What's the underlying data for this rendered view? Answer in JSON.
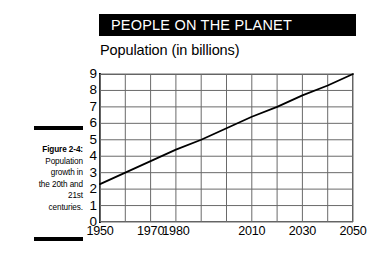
{
  "figure": {
    "header_title": "PEOPLE ON THE PLANET",
    "subtitle": "Population (in billions)",
    "caption": {
      "label": "Figure 2-4:",
      "lines": [
        "Population",
        "growth in",
        "the 20th and",
        "21st",
        "centuries."
      ]
    },
    "colors": {
      "header_background": "#000000",
      "header_text": "#ffffff",
      "grid_line": "#6a6a6a",
      "series_line": "#000000",
      "page_background": "#ffffff",
      "rule": "#000000"
    }
  },
  "chart_data": {
    "type": "line",
    "title": "Population (in billions)",
    "xlabel": "",
    "ylabel": "",
    "grid": true,
    "legend": "none",
    "xlim": [
      1950,
      2050
    ],
    "ylim": [
      0,
      9
    ],
    "x_tick_labels": [
      "1950",
      "1970",
      "1980",
      "2010",
      "2030",
      "2050"
    ],
    "x_tick_values": [
      1950,
      1970,
      1980,
      2010,
      2030,
      2050
    ],
    "x_gridline_values": [
      1950,
      1960,
      1970,
      1980,
      1990,
      2000,
      2010,
      2020,
      2030,
      2040,
      2050
    ],
    "y_tick_labels": [
      "0",
      "1",
      "2",
      "3",
      "4",
      "5",
      "6",
      "7",
      "8",
      "9"
    ],
    "y_tick_values": [
      0,
      1,
      2,
      3,
      4,
      5,
      6,
      7,
      8,
      9
    ],
    "series": [
      {
        "name": "World population",
        "x": [
          1950,
          1960,
          1970,
          1980,
          1990,
          2000,
          2010,
          2020,
          2030,
          2040,
          2050
        ],
        "values": [
          2.3,
          3.0,
          3.7,
          4.4,
          5.0,
          5.7,
          6.4,
          7.0,
          7.7,
          8.3,
          9.0
        ]
      }
    ]
  }
}
